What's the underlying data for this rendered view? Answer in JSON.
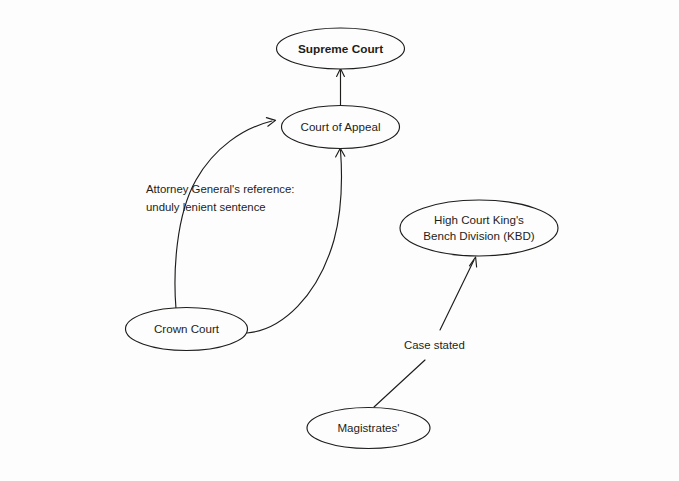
{
  "diagram": {
    "background_color": "#fdfdfd",
    "stroke_color": "#1d1d1b",
    "nodes": {
      "supreme_court": {
        "label": "Supreme Court",
        "bold": true
      },
      "court_of_appeal": {
        "label": "Court of Appeal",
        "bold": false
      },
      "high_court_kbd": {
        "line1": "High Court King's",
        "line2": "Bench Division (KBD)",
        "bold": false
      },
      "crown_court": {
        "label": "Crown Court",
        "bold": false
      },
      "magistrates": {
        "label": "Magistrates'",
        "bold": false
      }
    },
    "edge_labels": {
      "attorney_general": {
        "line1": "Attorney General's reference:",
        "line2": "unduly lenient sentence"
      },
      "case_stated": {
        "label": "Case stated"
      }
    }
  }
}
